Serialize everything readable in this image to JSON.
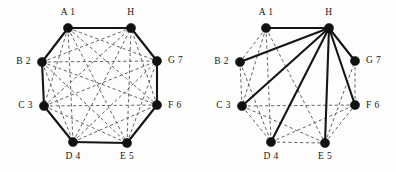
{
  "figure": {
    "background_color": "#fdfdfc",
    "solid_edge_color": "#151515",
    "dashed_edge_color": "#5c5c5c",
    "node_color": "#111111"
  },
  "nodes": [
    {
      "id": "A",
      "label": "A 1",
      "x": 68,
      "y": 28,
      "label_x": 68,
      "label_y": 15,
      "anchor": "middle"
    },
    {
      "id": "H",
      "label": "H",
      "x": 131,
      "y": 28,
      "label_x": 131,
      "label_y": 15,
      "anchor": "middle"
    },
    {
      "id": "G",
      "label": "G 7",
      "x": 157,
      "y": 61,
      "label_x": 168,
      "label_y": 63,
      "anchor": "start"
    },
    {
      "id": "F",
      "label": "F 6",
      "x": 157,
      "y": 105,
      "label_x": 168,
      "label_y": 108,
      "anchor": "start"
    },
    {
      "id": "E",
      "label": "E 5",
      "x": 127,
      "y": 143,
      "label_x": 127,
      "label_y": 159,
      "anchor": "middle"
    },
    {
      "id": "D",
      "label": "D 4",
      "x": 73,
      "y": 142,
      "label_x": 73,
      "label_y": 159,
      "anchor": "middle"
    },
    {
      "id": "C",
      "label": "C 3",
      "x": 44,
      "y": 106,
      "label_x": 33,
      "label_y": 108,
      "anchor": "end"
    },
    {
      "id": "B",
      "label": "B 2",
      "x": 42,
      "y": 62,
      "label_x": 31,
      "label_y": 64,
      "anchor": "end"
    }
  ],
  "left_graph": {
    "name": "complete-octagon-hamiltonian-cycle",
    "node_radius": 4.6,
    "solid_edges": [
      [
        "A",
        "H"
      ],
      [
        "H",
        "G"
      ],
      [
        "G",
        "F"
      ],
      [
        "F",
        "E"
      ],
      [
        "E",
        "D"
      ],
      [
        "D",
        "C"
      ],
      [
        "C",
        "B"
      ],
      [
        "B",
        "A"
      ]
    ],
    "dashed_edges": [
      [
        "A",
        "C"
      ],
      [
        "A",
        "D"
      ],
      [
        "A",
        "E"
      ],
      [
        "A",
        "F"
      ],
      [
        "A",
        "G"
      ],
      [
        "B",
        "D"
      ],
      [
        "B",
        "E"
      ],
      [
        "B",
        "F"
      ],
      [
        "B",
        "G"
      ],
      [
        "B",
        "H"
      ],
      [
        "C",
        "E"
      ],
      [
        "C",
        "F"
      ],
      [
        "C",
        "G"
      ],
      [
        "C",
        "H"
      ],
      [
        "D",
        "F"
      ],
      [
        "D",
        "G"
      ],
      [
        "D",
        "H"
      ],
      [
        "E",
        "G"
      ],
      [
        "E",
        "H"
      ],
      [
        "F",
        "H"
      ]
    ]
  },
  "right_graph": {
    "name": "star-spanning-tree-on-H",
    "node_radius": 4.6,
    "solid_edges": [
      [
        "H",
        "A"
      ],
      [
        "H",
        "B"
      ],
      [
        "H",
        "C"
      ],
      [
        "H",
        "D"
      ],
      [
        "H",
        "E"
      ],
      [
        "H",
        "F"
      ],
      [
        "H",
        "G"
      ]
    ],
    "dashed_edges": [
      [
        "A",
        "B"
      ],
      [
        "B",
        "C"
      ],
      [
        "C",
        "D"
      ],
      [
        "D",
        "E"
      ],
      [
        "E",
        "F"
      ],
      [
        "F",
        "G"
      ],
      [
        "A",
        "C"
      ],
      [
        "A",
        "D"
      ],
      [
        "A",
        "E"
      ],
      [
        "B",
        "D"
      ],
      [
        "C",
        "E"
      ],
      [
        "C",
        "F"
      ],
      [
        "D",
        "F"
      ],
      [
        "E",
        "G"
      ]
    ]
  }
}
